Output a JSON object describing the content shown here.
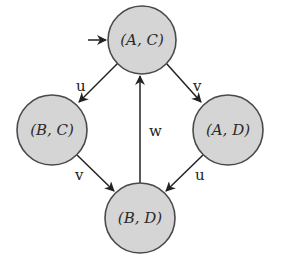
{
  "diagram": {
    "type": "state-transition-graph",
    "colors": {
      "node_fill": "#d5d5d5",
      "node_stroke": "#4a4a4a",
      "edge": "#222222",
      "background": "#ffffff"
    },
    "initial_state": "AC",
    "nodes": [
      {
        "id": "AC",
        "label": "(A, C)",
        "cx": 142,
        "cy": 40,
        "r": 34
      },
      {
        "id": "BC",
        "label": "(B, C)",
        "cx": 52,
        "cy": 130,
        "r": 35
      },
      {
        "id": "AD",
        "label": "(A, D)",
        "cx": 228,
        "cy": 130,
        "r": 35
      },
      {
        "id": "BD",
        "label": "(B, D)",
        "cx": 140,
        "cy": 218,
        "r": 35
      }
    ],
    "edges": [
      {
        "from": "AC",
        "to": "BC",
        "label": "u",
        "x1": 118,
        "y1": 63,
        "x2": 79,
        "y2": 102,
        "lx": 82,
        "ly": 88
      },
      {
        "from": "AC",
        "to": "AD",
        "label": "v",
        "x1": 166,
        "y1": 63,
        "x2": 201,
        "y2": 102,
        "lx": 198,
        "ly": 88
      },
      {
        "from": "BC",
        "to": "BD",
        "label": "v",
        "x1": 77,
        "y1": 155,
        "x2": 114,
        "y2": 191,
        "lx": 80,
        "ly": 177
      },
      {
        "from": "AD",
        "to": "BD",
        "label": "u",
        "x1": 203,
        "y1": 155,
        "x2": 166,
        "y2": 191,
        "lx": 200,
        "ly": 177
      },
      {
        "from": "BD",
        "to": "AC",
        "label": "w",
        "x1": 140,
        "y1": 183,
        "x2": 140,
        "y2": 76,
        "lx": 156,
        "ly": 133
      }
    ],
    "initial_arrow": {
      "x1": 88,
      "y1": 40,
      "x2": 106,
      "y2": 40
    }
  }
}
